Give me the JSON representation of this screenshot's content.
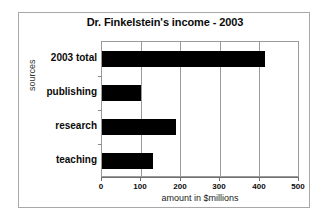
{
  "figure": {
    "background_color": "#ffffff",
    "frame_color": "#a8a8a8",
    "bar_color": "#000000",
    "grid_color": "#9a9a9a"
  },
  "chart_data": {
    "type": "bar",
    "orientation": "horizontal",
    "title": "Dr. Finkelstein's income - 2003",
    "xlabel": "amount in $millions",
    "ylabel": "sources",
    "categories": [
      "2003 total",
      "publishing",
      "research",
      "teaching"
    ],
    "values": [
      415,
      100,
      190,
      130
    ],
    "series": [
      {
        "name": "income",
        "values": [
          415,
          100,
          190,
          130
        ]
      }
    ],
    "xlim": [
      0,
      500
    ],
    "xticks": [
      0,
      100,
      200,
      300,
      400,
      500
    ],
    "xticklabels": [
      "0",
      "100",
      "200",
      "300",
      "400",
      "500"
    ],
    "grid": true,
    "grid_axis": "x",
    "legend": false,
    "legend_position": "none"
  }
}
